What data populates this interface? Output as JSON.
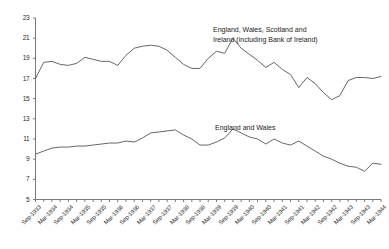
{
  "chart_data": {
    "type": "line",
    "title": "",
    "subtitle": "",
    "xlabel": "",
    "ylabel": "",
    "ylim": [
      5,
      23
    ],
    "ytick_values": [
      5,
      7,
      9,
      11,
      13,
      15,
      17,
      19,
      21,
      23
    ],
    "ytick_labels": [
      "5",
      "7",
      "9",
      "11",
      "13",
      "15",
      "17",
      "19",
      "21",
      "23"
    ],
    "grid": false,
    "legend_position": "inline-annotation",
    "x": [
      "Sep-1933",
      "Dec-1933",
      "Mar-1934",
      "Jun-1934",
      "Sep-1934",
      "Dec-1934",
      "Mar-1935",
      "Jun-1935",
      "Sep-1935",
      "Dec-1935",
      "Mar-1936",
      "Jun-1936",
      "Sep-1936",
      "Dec-1936",
      "Mar-1937",
      "Jun-1937",
      "Sep-1937",
      "Dec-1937",
      "Mar-1938",
      "Jun-1938",
      "Sep-1938",
      "Dec-1938",
      "Mar-1939",
      "Jun-1939",
      "Sep-1939",
      "Dec-1939",
      "Mar-1940",
      "Jun-1940",
      "Sep-1940",
      "Dec-1940",
      "Mar-1941",
      "Jun-1941",
      "Sep-1941",
      "Dec-1941",
      "Mar-1942",
      "Jun-1942",
      "Sep-1942",
      "Dec-1942",
      "Mar-1943",
      "Jun-1943",
      "Sep-1943",
      "Dec-1943",
      "Mar-1944"
    ],
    "xtick_labels": [
      "Sep-1933",
      "Mar-1934",
      "Sep-1934",
      "Mar-1935",
      "Sep-1935",
      "Mar-1936",
      "Sep-1936",
      "Mar-1937",
      "Sep-1937",
      "Mar-1938",
      "Sep-1938",
      "Mar-1939",
      "Sep-1939",
      "Mar-1940",
      "Sep-1940",
      "Mar-1941",
      "Sep-1941",
      "Mar-1942",
      "Sep-1942",
      "Mar-1943",
      "Sep-1943",
      "Mar-1944"
    ],
    "series": [
      {
        "name": "England, Wales, Scotland and Ireland (including Bank of Ireland)",
        "color": "#555555",
        "values": [
          17.0,
          18.6,
          18.7,
          18.4,
          18.3,
          18.5,
          19.1,
          18.9,
          18.7,
          18.7,
          18.3,
          19.3,
          20.0,
          20.2,
          20.3,
          20.2,
          19.8,
          19.1,
          18.4,
          18.0,
          18.0,
          19.0,
          19.7,
          19.5,
          21.0,
          20.0,
          19.4,
          18.8,
          18.1,
          18.6,
          17.9,
          17.4,
          16.1,
          17.1,
          16.5,
          15.6,
          14.9,
          15.3,
          16.8,
          17.1,
          17.1,
          17.0,
          17.2
        ]
      },
      {
        "name": "England and Wales",
        "color": "#555555",
        "values": [
          9.5,
          9.8,
          10.1,
          10.2,
          10.2,
          10.3,
          10.3,
          10.4,
          10.5,
          10.6,
          10.6,
          10.8,
          10.7,
          11.1,
          11.6,
          11.7,
          11.8,
          11.9,
          11.4,
          11.0,
          10.4,
          10.4,
          10.7,
          11.1,
          12.0,
          11.6,
          11.2,
          11.0,
          10.5,
          11.0,
          10.6,
          10.4,
          10.8,
          10.3,
          9.8,
          9.3,
          9.0,
          8.6,
          8.3,
          8.2,
          7.8,
          8.6,
          8.5
        ]
      }
    ],
    "annotations": [
      {
        "id": "upper-series-label",
        "lines": [
          "England, Wales, Scotland  and",
          "Ireland (including Bank of Ireland)"
        ]
      },
      {
        "id": "lower-series-label",
        "lines": [
          "England and Wales"
        ]
      }
    ]
  }
}
